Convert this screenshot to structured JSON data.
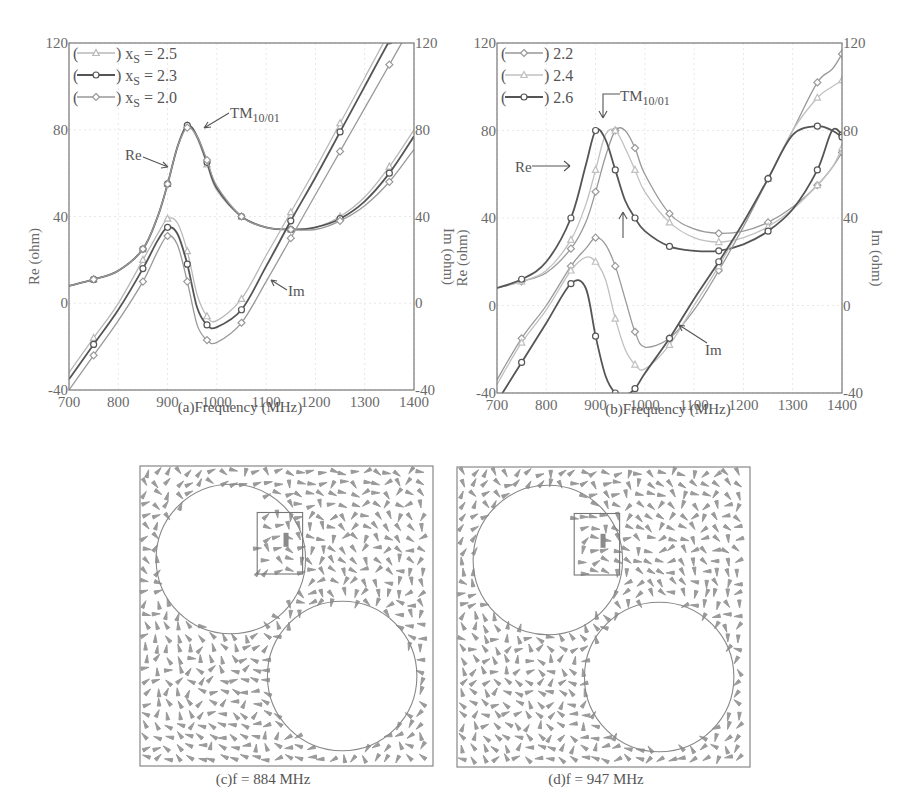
{
  "chart_data": [
    {
      "id": "a",
      "type": "line",
      "caption": "(a)Frequency (MHz)",
      "xlabel": "Frequency (MHz)",
      "ylabel_left": "Re (ohm)",
      "ylabel_right": "Im (ohm)",
      "xlim": [
        700,
        1400
      ],
      "ylim": [
        -40,
        120
      ],
      "x_ticks": [
        "700",
        "800",
        "900",
        "1000",
        "1100",
        "1200",
        "1300",
        "1400"
      ],
      "y_ticks_left": [
        "-40",
        "0",
        "40",
        "80",
        "120"
      ],
      "y_ticks_right": [
        "-40",
        "0",
        "40",
        "80",
        "120"
      ],
      "grid": true,
      "legend_position": "upper-left",
      "legend": [
        {
          "label": "x",
          "sub": "S",
          "value": " = 2.5",
          "color": "#b8b8b8",
          "marker": "triangle"
        },
        {
          "label": "x",
          "sub": "S",
          "value": " = 2.3",
          "color": "#555555",
          "marker": "circle"
        },
        {
          "label": "x",
          "sub": "S",
          "value": " = 2.0",
          "color": "#999999",
          "marker": "diamond"
        }
      ],
      "annotations": [
        {
          "text": "TM",
          "sub": "10/01",
          "target": "Re peak ~945 MHz"
        },
        {
          "text": "Re",
          "target": "Re curve"
        },
        {
          "text": "Im",
          "target": "Im curve"
        }
      ],
      "x": [
        700,
        750,
        800,
        850,
        880,
        900,
        920,
        940,
        960,
        980,
        1000,
        1050,
        1100,
        1150,
        1200,
        1250,
        1300,
        1350,
        1400
      ],
      "series": [
        {
          "name": "Re xS=2.5",
          "color": "#b8b8b8",
          "values": [
            8,
            11,
            15,
            25,
            40,
            55,
            72,
            82,
            76,
            64,
            52,
            40,
            35,
            34,
            35,
            40,
            49,
            63,
            80
          ]
        },
        {
          "name": "Re xS=2.3",
          "color": "#555555",
          "values": [
            8,
            11,
            15,
            25,
            40,
            55,
            72,
            82,
            77,
            65,
            53,
            40,
            35,
            34,
            35,
            39,
            47,
            60,
            77
          ]
        },
        {
          "name": "Re xS=2.0",
          "color": "#999999",
          "values": [
            8,
            11,
            15,
            25,
            40,
            55,
            72,
            81,
            77,
            66,
            54,
            40,
            35,
            34,
            34,
            38,
            45,
            56,
            71
          ]
        },
        {
          "name": "Im xS=2.5",
          "color": "#b8b8b8",
          "values": [
            -32,
            -16,
            0,
            20,
            32,
            39,
            37,
            24,
            4,
            -6,
            -8,
            2,
            22,
            42,
            62,
            83,
            104,
            125,
            145
          ]
        },
        {
          "name": "Im xS=2.3",
          "color": "#555555",
          "values": [
            -35,
            -19,
            -3,
            16,
            29,
            35,
            32,
            18,
            -2,
            -10,
            -11,
            -3,
            17,
            38,
            58,
            79,
            100,
            121,
            141
          ]
        },
        {
          "name": "Im xS=2.0",
          "color": "#999999",
          "values": [
            -40,
            -24,
            -8,
            10,
            24,
            31,
            27,
            10,
            -10,
            -17,
            -18,
            -9,
            10,
            30,
            50,
            70,
            90,
            110,
            130
          ]
        }
      ]
    },
    {
      "id": "b",
      "type": "line",
      "caption": "(b)Frequency (MHz)",
      "xlabel": "Frequency (MHz)",
      "ylabel_left": "Re (ohm)",
      "ylabel_right": "Im (ohm)",
      "xlim": [
        700,
        1400
      ],
      "ylim": [
        -40,
        120
      ],
      "x_ticks": [
        "700",
        "800",
        "900",
        "1000",
        "1100",
        "1200",
        "1300",
        "1400"
      ],
      "y_ticks_left": [
        "-40",
        "0",
        "40",
        "80",
        "120"
      ],
      "y_ticks_right": [
        "-40",
        "0",
        "40",
        "80",
        "120"
      ],
      "grid": true,
      "legend_position": "upper-left",
      "legend": [
        {
          "label": "2.2",
          "color": "#999999",
          "marker": "diamond"
        },
        {
          "label": "2.4",
          "color": "#c0c0c0",
          "marker": "triangle"
        },
        {
          "label": "2.6",
          "color": "#555555",
          "marker": "circle"
        }
      ],
      "annotations": [
        {
          "text": "TM",
          "sub": "10/01",
          "target": "Re peak"
        },
        {
          "text": "Re",
          "target": "Re curve"
        },
        {
          "text": "Im",
          "target": "Im curve"
        }
      ],
      "x": [
        700,
        750,
        800,
        850,
        880,
        900,
        920,
        940,
        960,
        980,
        1000,
        1050,
        1100,
        1150,
        1200,
        1250,
        1300,
        1350,
        1380,
        1400
      ],
      "series": [
        {
          "name": "Re 2.2",
          "color": "#999999",
          "values": [
            8,
            11,
            15,
            26,
            38,
            52,
            68,
            80,
            80,
            72,
            60,
            42,
            35,
            33,
            34,
            38,
            45,
            55,
            63,
            70
          ]
        },
        {
          "name": "Re 2.4",
          "color": "#c0c0c0",
          "values": [
            8,
            11,
            16,
            30,
            46,
            62,
            78,
            80,
            72,
            62,
            52,
            38,
            31,
            29,
            31,
            36,
            44,
            55,
            63,
            72
          ]
        },
        {
          "name": "Re 2.6",
          "color": "#555555",
          "values": [
            8,
            12,
            20,
            40,
            64,
            80,
            76,
            62,
            48,
            40,
            34,
            27,
            25,
            25,
            28,
            34,
            44,
            62,
            80,
            78
          ]
        },
        {
          "name": "Im 2.2",
          "color": "#999999",
          "values": [
            -34,
            -15,
            0,
            18,
            26,
            31,
            28,
            18,
            3,
            -12,
            -19,
            -15,
            -2,
            16,
            36,
            58,
            80,
            102,
            108,
            115
          ]
        },
        {
          "name": "Im 2.4",
          "color": "#c0c0c0",
          "values": [
            -36,
            -17,
            -2,
            16,
            22,
            20,
            12,
            -6,
            -20,
            -27,
            -29,
            -18,
            0,
            18,
            38,
            58,
            80,
            95,
            100,
            103
          ]
        },
        {
          "name": "Im 2.6",
          "color": "#555555",
          "values": [
            -44,
            -26,
            -8,
            10,
            8,
            -14,
            -32,
            -40,
            -41,
            -38,
            -31,
            -15,
            3,
            20,
            38,
            58,
            78,
            82,
            80,
            77
          ]
        }
      ]
    },
    {
      "id": "c",
      "type": "field-plot",
      "caption": "(c)f = 884 MHz",
      "frequency_mhz": 884
    },
    {
      "id": "d",
      "type": "field-plot",
      "caption": "(d)f = 947 MHz",
      "frequency_mhz": 947
    }
  ]
}
